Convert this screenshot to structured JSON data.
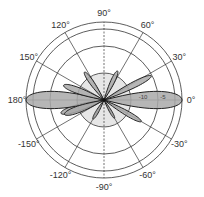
{
  "chart_data": {
    "type": "polar",
    "title": "",
    "center": [
      104,
      100
    ],
    "rings": [
      {
        "radius": 27,
        "filled": true
      },
      {
        "radius": 54,
        "filled": false
      },
      {
        "radius": 71,
        "filled": false
      },
      {
        "radius": 78,
        "filled": false
      }
    ],
    "angle_ticks": [
      0,
      30,
      60,
      90,
      120,
      150,
      180,
      -150,
      -120,
      -90,
      -60,
      -30
    ],
    "angle_labels": [
      {
        "angle": 0,
        "text": "0°"
      },
      {
        "angle": 30,
        "text": "30°"
      },
      {
        "angle": 60,
        "text": "60°"
      },
      {
        "angle": 90,
        "text": "90°"
      },
      {
        "angle": 120,
        "text": "120°"
      },
      {
        "angle": 150,
        "text": "150°"
      },
      {
        "angle": 180,
        "text": "180°"
      },
      {
        "angle": -150,
        "text": "-150°"
      },
      {
        "angle": -120,
        "text": "-120°"
      },
      {
        "angle": -90,
        "text": "-90°"
      },
      {
        "angle": -60,
        "text": "-60°"
      },
      {
        "angle": -30,
        "text": "-30°"
      }
    ],
    "radial_labels": [
      {
        "text": "-10",
        "x": 143,
        "y": 99
      },
      {
        "text": "-5",
        "x": 163,
        "y": 99
      }
    ],
    "radial_unit": "dB",
    "series": [
      {
        "name": "radiation pattern",
        "lobes": [
          {
            "angle": 0,
            "radius": 78,
            "width_deg": 14
          },
          {
            "angle": 180,
            "radius": 78,
            "width_deg": 14
          },
          {
            "angle": 27,
            "radius": 53,
            "width_deg": 7
          },
          {
            "angle": 65,
            "radius": 32,
            "width_deg": 8
          },
          {
            "angle": 125,
            "radius": 34,
            "width_deg": 8
          },
          {
            "angle": 160,
            "radius": 43,
            "width_deg": 9
          },
          {
            "angle": -160,
            "radius": 42,
            "width_deg": 10
          },
          {
            "angle": -120,
            "radius": 22,
            "width_deg": 8
          },
          {
            "angle": -60,
            "radius": 21,
            "width_deg": 7
          },
          {
            "angle": -30,
            "radius": 43,
            "width_deg": 7
          }
        ]
      }
    ],
    "colors": {
      "lobe_fill": "#a9a9a9",
      "lobe_stroke": "#222222",
      "grid": "#333333",
      "inner_disc": "#e6e6e6"
    }
  }
}
